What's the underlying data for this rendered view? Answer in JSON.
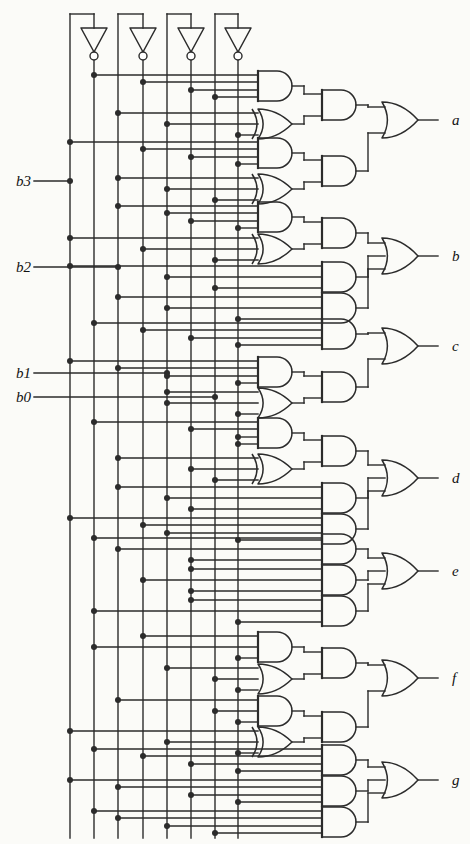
{
  "figure": {
    "kind": "logic-circuit-schematic",
    "title": "",
    "stroke_color": "#2b2b2b",
    "background_color": "#fbfbf8"
  },
  "inputs": [
    {
      "name": "b3",
      "label": "b3",
      "x": 70,
      "y": 181,
      "comp_x": 94
    },
    {
      "name": "b2",
      "label": "b2",
      "x": 118,
      "y": 267,
      "comp_x": 143
    },
    {
      "name": "b1",
      "label": "b1",
      "x": 167,
      "y": 373,
      "comp_x": 191
    },
    {
      "name": "b0",
      "label": "b0",
      "x": 215,
      "y": 397,
      "comp_x": 238
    }
  ],
  "inverters": [
    {
      "name": "inv-b3",
      "x": 94,
      "y": 40
    },
    {
      "name": "inv-b2",
      "x": 143,
      "y": 40
    },
    {
      "name": "inv-b1",
      "x": 191,
      "y": 40
    },
    {
      "name": "inv-b0",
      "x": 238,
      "y": 40
    }
  ],
  "outputs": [
    {
      "name": "a",
      "label": "a",
      "y": 120
    },
    {
      "name": "b",
      "label": "b",
      "y": 256
    },
    {
      "name": "c",
      "label": "c",
      "y": 346
    },
    {
      "name": "d",
      "label": "d",
      "y": 478
    },
    {
      "name": "e",
      "label": "e",
      "y": 571
    },
    {
      "name": "f",
      "label": "f",
      "y": 678
    },
    {
      "name": "g",
      "label": "g",
      "y": 780
    }
  ],
  "rails": {
    "true_lines_x": [
      70,
      118,
      167,
      215
    ],
    "complement_lines_x": [
      94,
      143,
      191,
      238
    ],
    "top_y": 14,
    "bottom_y": 838
  },
  "geometry": {
    "stage1_x": 258,
    "stage1_w": 34,
    "stage2_x": 322,
    "stage2_w": 34,
    "or_x": 382,
    "or_w": 36,
    "label_x": 452,
    "gate_h": 30
  },
  "sections": [
    {
      "name": "segment-a",
      "output": "a",
      "stage1": [
        {
          "type": "and",
          "y": 86,
          "inputs": [
            {
              "x": 94,
              "y": 79
            },
            {
              "x": 143,
              "y": 79
            },
            {
              "x": 191,
              "y": 79
            },
            {
              "x": 215,
              "y": 93
            }
          ]
        },
        {
          "type": "xor",
          "y": 124,
          "inputs": [
            {
              "x": 118,
              "y": 117
            },
            {
              "x": 167,
              "y": 117
            },
            {
              "x": 238,
              "y": 131
            }
          ]
        },
        {
          "type": "and",
          "y": 153,
          "inputs": [
            {
              "x": 70,
              "y": 146
            },
            {
              "x": 143,
              "y": 146
            },
            {
              "x": 191,
              "y": 146
            },
            {
              "x": 238,
              "y": 160
            }
          ]
        },
        {
          "type": "xor",
          "y": 189,
          "inputs": [
            {
              "x": 118,
              "y": 182
            },
            {
              "x": 167,
              "y": 182
            },
            {
              "x": 215,
              "y": 196
            }
          ]
        }
      ],
      "stage2": [
        {
          "type": "and",
          "y": 105,
          "from": [
            0,
            1
          ]
        },
        {
          "type": "and",
          "y": 171,
          "from": [
            2,
            3
          ]
        }
      ],
      "or_inputs": 2
    },
    {
      "name": "segment-b",
      "output": "b",
      "stage1": [
        {
          "type": "and",
          "y": 217,
          "inputs": [
            {
              "x": 118,
              "y": 210
            },
            {
              "x": 167,
              "y": 210
            },
            {
              "x": 191,
              "y": 224
            },
            {
              "x": 238,
              "y": 224
            }
          ]
        },
        {
          "type": "xor",
          "y": 249,
          "inputs": [
            {
              "x": 70,
              "y": 242
            },
            {
              "x": 143,
              "y": 242
            },
            {
              "x": 215,
              "y": 256
            }
          ]
        }
      ],
      "stage2": [
        {
          "type": "and",
          "y": 233,
          "from": [
            0,
            1
          ]
        },
        {
          "type": "and",
          "y": 277,
          "direct_inputs": [
            {
              "x": 70,
              "y": 270
            },
            {
              "x": 167,
              "y": 277
            },
            {
              "x": 215,
              "y": 284
            }
          ]
        },
        {
          "type": "and",
          "y": 308,
          "direct_inputs": [
            {
              "x": 118,
              "y": 300
            },
            {
              "x": 167,
              "y": 308
            },
            {
              "x": 238,
              "y": 316
            }
          ]
        }
      ],
      "or_inputs": 3
    },
    {
      "name": "segment-c",
      "output": "c",
      "stage1": [
        {
          "type": "and",
          "y": 372,
          "inputs": [
            {
              "x": 70,
              "y": 365
            },
            {
              "x": 118,
              "y": 379
            },
            {
              "x": 167,
              "y": 379
            },
            {
              "x": 238,
              "y": 379
            }
          ]
        },
        {
          "type": "or",
          "y": 403,
          "inputs": [
            {
              "x": 167,
              "y": 396
            },
            {
              "x": 167,
              "y": 410
            },
            {
              "x": 238,
              "y": 410
            }
          ]
        }
      ],
      "stage2": [
        {
          "type": "and",
          "y": 334,
          "direct_inputs": [
            {
              "x": 94,
              "y": 326
            },
            {
              "x": 143,
              "y": 334
            },
            {
              "x": 191,
              "y": 341
            },
            {
              "x": 238,
              "y": 348
            }
          ]
        },
        {
          "type": "and",
          "y": 387,
          "from": [
            0,
            1
          ]
        }
      ],
      "or_inputs": 2
    },
    {
      "name": "segment-d",
      "output": "d",
      "stage1": [
        {
          "type": "and",
          "y": 433,
          "inputs": [
            {
              "x": 94,
              "y": 426
            },
            {
              "x": 191,
              "y": 426
            },
            {
              "x": 238,
              "y": 440
            },
            {
              "x": 238,
              "y": 440
            }
          ]
        },
        {
          "type": "xor",
          "y": 469,
          "inputs": [
            {
              "x": 118,
              "y": 462
            },
            {
              "x": 191,
              "y": 476
            },
            {
              "x": 215,
              "y": 476
            }
          ]
        }
      ],
      "stage2": [
        {
          "type": "and",
          "y": 451,
          "from": [
            0,
            1
          ]
        },
        {
          "type": "and",
          "y": 498,
          "direct_inputs": [
            {
              "x": 118,
              "y": 490
            },
            {
              "x": 167,
              "y": 498
            },
            {
              "x": 191,
              "y": 505
            }
          ]
        },
        {
          "type": "and",
          "y": 529,
          "direct_inputs": [
            {
              "x": 70,
              "y": 517
            },
            {
              "x": 143,
              "y": 522
            },
            {
              "x": 167,
              "y": 529
            },
            {
              "x": 238,
              "y": 536
            }
          ]
        }
      ],
      "or_inputs": 3
    },
    {
      "name": "segment-e",
      "output": "e",
      "stage1": [],
      "stage2": [
        {
          "type": "and",
          "y": 549,
          "direct_inputs": [
            {
              "x": 94,
              "y": 542
            },
            {
              "x": 118,
              "y": 549
            },
            {
              "x": 191,
              "y": 556
            }
          ]
        },
        {
          "type": "and",
          "y": 580,
          "direct_inputs": [
            {
              "x": 191,
              "y": 572
            },
            {
              "x": 143,
              "y": 580
            },
            {
              "x": 191,
              "y": 588
            }
          ]
        },
        {
          "type": "and",
          "y": 611,
          "direct_inputs": [
            {
              "x": 191,
              "y": 604
            },
            {
              "x": 94,
              "y": 618
            },
            {
              "x": 238,
              "y": 618
            }
          ]
        }
      ],
      "or_inputs": 3
    },
    {
      "name": "segment-f",
      "output": "f",
      "stage1": [
        {
          "type": "and",
          "y": 647,
          "inputs": [
            {
              "x": 143,
              "y": 640
            },
            {
              "x": 94,
              "y": 654
            },
            {
              "x": 238,
              "y": 654
            }
          ]
        },
        {
          "type": "or",
          "y": 679,
          "inputs": [
            {
              "x": 167,
              "y": 672
            },
            {
              "x": 215,
              "y": 686
            },
            {
              "x": 238,
              "y": 686
            }
          ]
        },
        {
          "type": "and",
          "y": 711,
          "inputs": [
            {
              "x": 118,
              "y": 704
            },
            {
              "x": 215,
              "y": 718
            },
            {
              "x": 238,
              "y": 718
            }
          ]
        },
        {
          "type": "xor",
          "y": 742,
          "inputs": [
            {
              "x": 70,
              "y": 735
            },
            {
              "x": 167,
              "y": 749
            },
            {
              "x": 238,
              "y": 749
            }
          ]
        }
      ],
      "stage2": [
        {
          "type": "and",
          "y": 663,
          "from": [
            0,
            1
          ]
        },
        {
          "type": "and",
          "y": 727,
          "from": [
            2,
            3
          ]
        }
      ],
      "or_inputs": 2
    },
    {
      "name": "segment-g",
      "output": "g",
      "stage1": [],
      "stage2": [
        {
          "type": "and",
          "y": 760,
          "direct_inputs": [
            {
              "x": 94,
              "y": 752
            },
            {
              "x": 143,
              "y": 759
            },
            {
              "x": 191,
              "y": 766
            },
            {
              "x": 238,
              "y": 773
            }
          ]
        },
        {
          "type": "and",
          "y": 791,
          "direct_inputs": [
            {
              "x": 70,
              "y": 783
            },
            {
              "x": 118,
              "y": 790
            },
            {
              "x": 191,
              "y": 797
            },
            {
              "x": 238,
              "y": 804
            }
          ]
        },
        {
          "type": "and",
          "y": 822,
          "direct_inputs": [
            {
              "x": 94,
              "y": 814
            },
            {
              "x": 118,
              "y": 821
            },
            {
              "x": 167,
              "y": 828
            },
            {
              "x": 215,
              "y": 835
            }
          ]
        }
      ],
      "or_inputs": 3
    }
  ],
  "junction_dots_note": "filled circles mark wire connections to vertical input rails"
}
